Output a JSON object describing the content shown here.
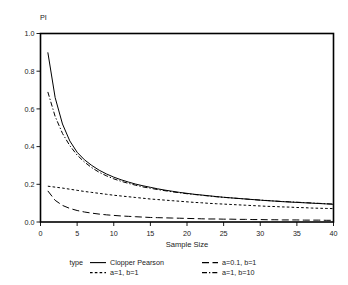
{
  "chart_data": {
    "type": "line",
    "title": "",
    "xlabel": "Sample Size",
    "ylabel": "PI",
    "xlim": [
      0,
      40
    ],
    "ylim": [
      0.0,
      1.0
    ],
    "xticks": [
      0,
      5,
      10,
      15,
      20,
      25,
      30,
      35,
      40
    ],
    "xtick_labels": [
      "0",
      "5",
      "10",
      "15",
      "20",
      "25",
      "30",
      "35",
      "40"
    ],
    "yticks": [
      0.0,
      0.2,
      0.4,
      0.6,
      0.8,
      1.0
    ],
    "ytick_labels": [
      "0.0",
      "0.2",
      "0.4",
      "0.6",
      "0.8",
      "1.0"
    ],
    "grid": false,
    "legend_position": "bottom",
    "legend_title": "type",
    "x": [
      1,
      2,
      3,
      4,
      5,
      6,
      7,
      8,
      9,
      10,
      11,
      12,
      13,
      14,
      15,
      16,
      17,
      18,
      19,
      20,
      21,
      22,
      23,
      24,
      25,
      26,
      27,
      28,
      29,
      30,
      31,
      32,
      33,
      34,
      35,
      36,
      37,
      38,
      39,
      40
    ],
    "series": [
      {
        "name": "Clopper Pearson",
        "style": "solid",
        "values": [
          0.9,
          0.66,
          0.52,
          0.43,
          0.37,
          0.33,
          0.3,
          0.275,
          0.255,
          0.238,
          0.224,
          0.212,
          0.201,
          0.192,
          0.184,
          0.176,
          0.169,
          0.163,
          0.157,
          0.152,
          0.147,
          0.143,
          0.139,
          0.135,
          0.131,
          0.128,
          0.125,
          0.122,
          0.119,
          0.116,
          0.113,
          0.111,
          0.108,
          0.106,
          0.104,
          0.102,
          0.1,
          0.098,
          0.096,
          0.094
        ]
      },
      {
        "name": "a=0.1, b=1",
        "style": "long-dash",
        "values": [
          0.165,
          0.115,
          0.088,
          0.072,
          0.061,
          0.053,
          0.047,
          0.042,
          0.038,
          0.035,
          0.032,
          0.03,
          0.028,
          0.026,
          0.024,
          0.023,
          0.022,
          0.021,
          0.02,
          0.019,
          0.018,
          0.017,
          0.016,
          0.016,
          0.015,
          0.015,
          0.014,
          0.014,
          0.013,
          0.013,
          0.012,
          0.012,
          0.011,
          0.011,
          0.011,
          0.01,
          0.01,
          0.01,
          0.009,
          0.009
        ]
      },
      {
        "name": "a=1, b=1",
        "style": "short-dash",
        "values": [
          0.19,
          0.185,
          0.18,
          0.174,
          0.168,
          0.162,
          0.157,
          0.152,
          0.147,
          0.142,
          0.138,
          0.134,
          0.13,
          0.126,
          0.122,
          0.119,
          0.116,
          0.113,
          0.11,
          0.107,
          0.104,
          0.102,
          0.099,
          0.097,
          0.095,
          0.093,
          0.091,
          0.089,
          0.087,
          0.085,
          0.083,
          0.082,
          0.08,
          0.079,
          0.077,
          0.076,
          0.074,
          0.073,
          0.072,
          0.071
        ]
      },
      {
        "name": "a=1, b=10",
        "style": "dash-dot",
        "values": [
          0.69,
          0.56,
          0.47,
          0.405,
          0.355,
          0.318,
          0.288,
          0.264,
          0.245,
          0.229,
          0.216,
          0.205,
          0.195,
          0.186,
          0.179,
          0.172,
          0.166,
          0.16,
          0.155,
          0.15,
          0.146,
          0.142,
          0.138,
          0.134,
          0.131,
          0.128,
          0.125,
          0.122,
          0.119,
          0.116,
          0.114,
          0.111,
          0.109,
          0.107,
          0.105,
          0.103,
          0.101,
          0.099,
          0.097,
          0.095
        ]
      }
    ],
    "legend_entries": [
      {
        "label": "Clopper Pearson",
        "style": "solid"
      },
      {
        "label": "a=0.1, b=1",
        "style": "long-dash"
      },
      {
        "label": "a=1, b=1",
        "style": "short-dash"
      },
      {
        "label": "a=1, b=10",
        "style": "dash-dot"
      }
    ]
  }
}
